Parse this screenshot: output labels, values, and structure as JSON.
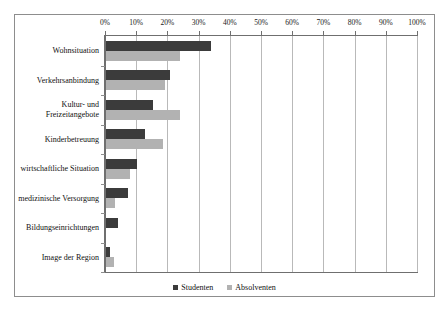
{
  "chart_data": {
    "type": "bar",
    "orientation": "horizontal",
    "title": "",
    "subtitle": "",
    "xlabel": "",
    "ylabel": "",
    "xlim": [
      0,
      100
    ],
    "xticks": [
      "0%",
      "10%",
      "20%",
      "30%",
      "40%",
      "50%",
      "60%",
      "70%",
      "80%",
      "90%",
      "100%"
    ],
    "xtick_values": [
      0,
      10,
      20,
      30,
      40,
      50,
      60,
      70,
      80,
      90,
      100
    ],
    "grid": true,
    "legend_position": "bottom",
    "categories": [
      "Wohnsituation",
      "Verkehrsanbindung",
      "Kultur- und\nFreizeitangebote",
      "Kinderbetreuung",
      "wirtschaftliche Situation",
      "medizinische Versorgung",
      "Bildungseinrichtungen",
      "Image der Region"
    ],
    "series": [
      {
        "name": "Studenten",
        "color": "#3b3b3b",
        "values": [
          33.5,
          20.5,
          15.0,
          12.6,
          9.8,
          6.9,
          3.8,
          1.2
        ]
      },
      {
        "name": "Absolventen",
        "color": "#b2b2b2",
        "values": [
          23.7,
          19.0,
          23.7,
          18.2,
          7.8,
          2.9,
          0.0,
          2.5
        ]
      }
    ]
  },
  "colors": {
    "series1": "#3b3b3b",
    "series2": "#b2b2b2",
    "grid": "#b9b9b9",
    "axis": "#6f6f6f",
    "frame": "#8d8d8d",
    "background": "#ffffff"
  }
}
